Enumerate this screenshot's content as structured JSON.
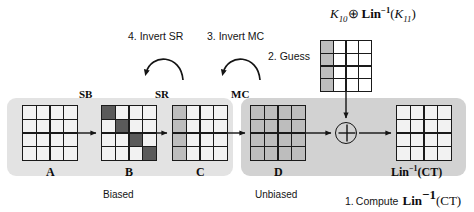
{
  "figure": {
    "title_formula": "K10 XOR Lin^-1(K11)",
    "background_color": "#ffffff"
  },
  "regions": [
    {
      "name": "Biased",
      "label": "Biased",
      "color": "#e3e3e3"
    },
    {
      "name": "Unbiased",
      "label": "Unbiased",
      "color": "#d2d2d2"
    }
  ],
  "key_formula": {
    "k10": "K",
    "k10_sub": "10",
    "xor_symbol": "⊕",
    "lin": "Lin",
    "lin_exp": "−1",
    "open_paren": "(",
    "k11": "K",
    "k11_sub": "11",
    "close_paren": ")"
  },
  "states": [
    {
      "id": "A",
      "label": "A",
      "fill": "all-white",
      "cells": [
        [
          "light",
          "light",
          "light",
          "light"
        ],
        [
          "light",
          "light",
          "light",
          "light"
        ],
        [
          "light",
          "light",
          "light",
          "light"
        ],
        [
          "light",
          "light",
          "light",
          "light"
        ]
      ]
    },
    {
      "id": "B",
      "label": "B",
      "fill": "dark-diagonal",
      "cells": [
        [
          "dark",
          "light",
          "light",
          "light"
        ],
        [
          "light",
          "dark",
          "light",
          "light"
        ],
        [
          "light",
          "light",
          "dark",
          "light"
        ],
        [
          "light",
          "light",
          "light",
          "dark"
        ]
      ]
    },
    {
      "id": "C",
      "label": "C",
      "fill": "first-column-shaded",
      "cells": [
        [
          "shade",
          "light",
          "light",
          "light"
        ],
        [
          "shade",
          "light",
          "light",
          "light"
        ],
        [
          "shade",
          "light",
          "light",
          "light"
        ],
        [
          "shade",
          "light",
          "light",
          "light"
        ]
      ]
    },
    {
      "id": "D",
      "label": "D",
      "fill": "all-shaded",
      "cells": [
        [
          "shade",
          "shade",
          "shade",
          "shade"
        ],
        [
          "shade",
          "shade",
          "shade",
          "shade"
        ],
        [
          "shade",
          "shade",
          "shade",
          "shade"
        ],
        [
          "shade",
          "shade",
          "shade",
          "shade"
        ]
      ]
    },
    {
      "id": "guess",
      "label": "",
      "fill": "first-column-shaded",
      "cells": [
        [
          "shade",
          "cell",
          "cell",
          "cell"
        ],
        [
          "shade",
          "cell",
          "cell",
          "cell"
        ],
        [
          "shade",
          "cell",
          "cell",
          "cell"
        ],
        [
          "shade",
          "cell",
          "cell",
          "cell"
        ]
      ]
    },
    {
      "id": "ct",
      "label": "Lin^-1(CT)",
      "fill": "all-white",
      "cells": [
        [
          "light",
          "light",
          "light",
          "light"
        ],
        [
          "light",
          "light",
          "light",
          "light"
        ],
        [
          "light",
          "light",
          "light",
          "light"
        ],
        [
          "light",
          "light",
          "light",
          "light"
        ]
      ]
    }
  ],
  "operations": [
    {
      "id": "SB",
      "label": "SB"
    },
    {
      "id": "SR",
      "label": "SR"
    },
    {
      "id": "MC",
      "label": "MC"
    }
  ],
  "steps": [
    {
      "number": "1",
      "label": "1. Compute"
    },
    {
      "number": "2",
      "label": "2. Guess"
    },
    {
      "number": "3",
      "label": "3. Invert MC"
    },
    {
      "number": "4",
      "label": "4. Invert SR"
    }
  ],
  "ct_label": {
    "lin": "Lin",
    "exp": "−1",
    "arg": "(CT)"
  },
  "colors": {
    "ink": "#141414",
    "band_biased": "#e3e3e3",
    "band_unbiased": "#d2d2d2",
    "cell_shade": "#bdbdbd",
    "cell_dark": "#5a5a5a",
    "cell_white": "#ffffff"
  }
}
